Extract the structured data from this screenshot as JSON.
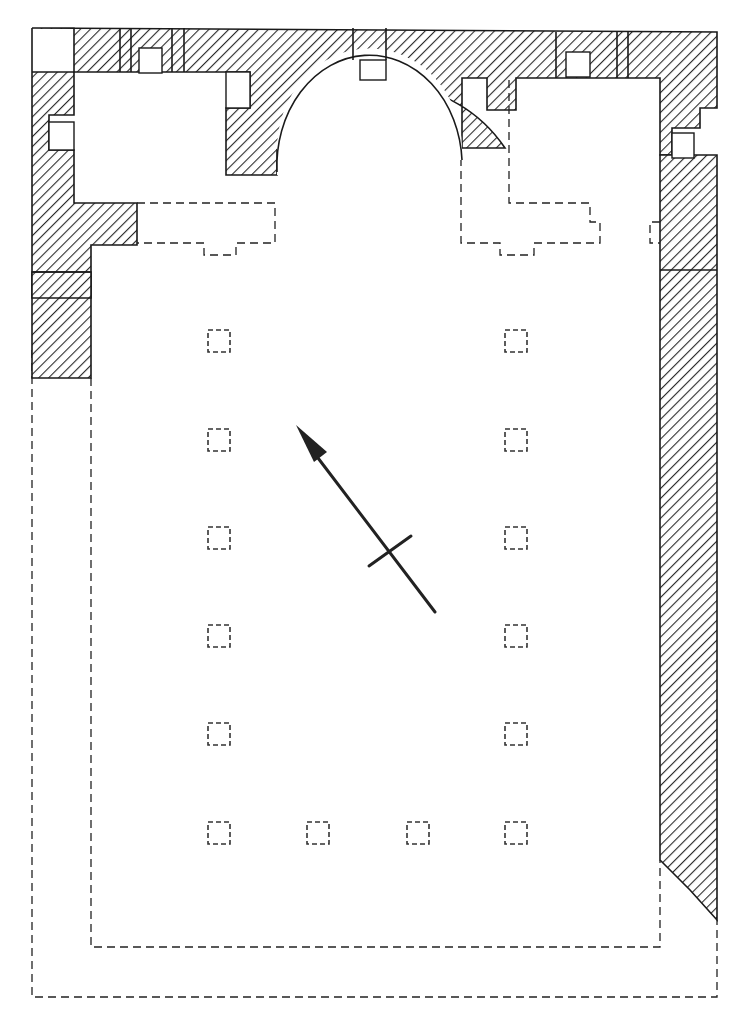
{
  "diagram": {
    "type": "architectural-floor-plan",
    "colors": {
      "ink": "#1a1a1a",
      "background": "#ffffff"
    },
    "north_arrow": {
      "icon": "north-arrow-icon",
      "tail": [
        435,
        612
      ],
      "head": [
        296,
        425
      ],
      "crossbar_center": [
        389,
        550
      ]
    },
    "column_bases": {
      "left_row": [
        [
          219,
          341
        ],
        [
          219,
          440
        ],
        [
          219,
          538
        ],
        [
          219,
          636
        ],
        [
          219,
          734
        ],
        [
          219,
          833
        ]
      ],
      "right_row": [
        [
          516,
          341
        ],
        [
          516,
          440
        ],
        [
          516,
          538
        ],
        [
          516,
          636
        ],
        [
          516,
          734
        ],
        [
          516,
          833
        ]
      ],
      "bottom_middle": [
        [
          318,
          833
        ],
        [
          418,
          833
        ]
      ]
    },
    "labels": []
  }
}
